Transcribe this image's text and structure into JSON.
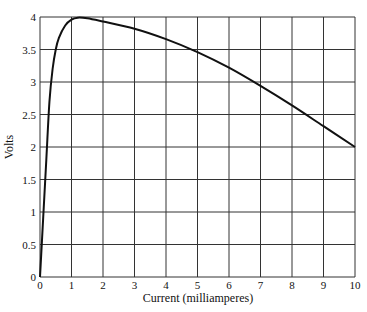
{
  "chart_data": {
    "type": "line",
    "title": "",
    "xlabel": "Current (milliamperes)",
    "ylabel": "Volts",
    "xlim": [
      0,
      10
    ],
    "ylim": [
      0,
      4
    ],
    "grid": true,
    "legend": "none",
    "x_ticks": [
      "0",
      "1",
      "2",
      "3",
      "4",
      "5",
      "6",
      "7",
      "8",
      "9",
      "10"
    ],
    "y_ticks": [
      "0",
      "0.5",
      "1",
      "1.5",
      "2",
      "2.5",
      "3",
      "3.5",
      "4"
    ],
    "series": [
      {
        "name": "Volts vs Current",
        "color": "#111111",
        "x": [
          0,
          0.1,
          0.2,
          0.3,
          0.4,
          0.5,
          0.6,
          0.8,
          1.0,
          1.2,
          1.5,
          2,
          3,
          4,
          5,
          6,
          7,
          8,
          9,
          10
        ],
        "y": [
          0,
          0.9,
          1.8,
          2.7,
          3.2,
          3.5,
          3.68,
          3.87,
          3.96,
          3.99,
          3.98,
          3.93,
          3.82,
          3.66,
          3.46,
          3.22,
          2.94,
          2.64,
          2.32,
          2.0
        ]
      }
    ]
  }
}
